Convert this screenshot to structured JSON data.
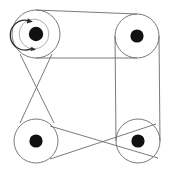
{
  "figure": {
    "background_color": "#ffffff",
    "line_color": "#6b6b6b",
    "hub_color": "#111111",
    "arrow_color": "#2b2b2b",
    "width": 171,
    "height": 176
  },
  "pulleys": [
    {
      "id": "top-left",
      "label": "",
      "cx": 36,
      "cy": 34,
      "radius": 24,
      "hub_radius": 7.2,
      "has_rotation_arrow": true,
      "rotation_direction": "counterclockwise"
    },
    {
      "id": "top-right",
      "label": "",
      "cx": 137,
      "cy": 36,
      "radius": 22,
      "hub_radius": 6.6,
      "has_rotation_arrow": false,
      "rotation_direction": ""
    },
    {
      "id": "bottom-left",
      "label": "",
      "cx": 36,
      "cy": 141,
      "radius": 22,
      "hub_radius": 6.6,
      "has_rotation_arrow": false,
      "rotation_direction": ""
    },
    {
      "id": "bottom-right",
      "label": "",
      "cx": 138,
      "cy": 141,
      "radius": 22,
      "hub_radius": 6.6,
      "has_rotation_arrow": false,
      "rotation_direction": ""
    }
  ],
  "belts": [
    {
      "id": "top-belt",
      "from": "top-left",
      "to": "top-right",
      "type": "open",
      "strands": [
        {
          "x1": 36,
          "y1": 10,
          "x2": 137,
          "y2": 14
        },
        {
          "x1": 36,
          "y1": 58,
          "x2": 137,
          "y2": 58
        }
      ]
    },
    {
      "id": "right-belt",
      "from": "top-right",
      "to": "bottom-right",
      "type": "open",
      "strands": [
        {
          "x1": 115,
          "y1": 36,
          "x2": 116,
          "y2": 141
        },
        {
          "x1": 159,
          "y1": 36,
          "x2": 160,
          "y2": 141
        }
      ]
    },
    {
      "id": "left-crossed-belt",
      "from": "top-left",
      "to": "bottom-left",
      "type": "crossed",
      "strands": [
        {
          "x1": 20,
          "y1": 54,
          "x2": 54,
          "y2": 123
        },
        {
          "x1": 52,
          "y1": 54,
          "x2": 20,
          "y2": 123
        }
      ]
    },
    {
      "id": "bottom-crossed-belt",
      "from": "bottom-left",
      "to": "bottom-right",
      "type": "crossed",
      "strands": [
        {
          "x1": 50,
          "y1": 126,
          "x2": 158,
          "y2": 158
        },
        {
          "x1": 50,
          "y1": 159,
          "x2": 156,
          "y2": 124
        }
      ]
    }
  ],
  "annotations": {
    "rotation_marker": "counterclockwise-arrow",
    "icon_names": [
      "pulley-icon",
      "belt-icon",
      "rotation-arrow-icon",
      "hub-icon"
    ]
  }
}
